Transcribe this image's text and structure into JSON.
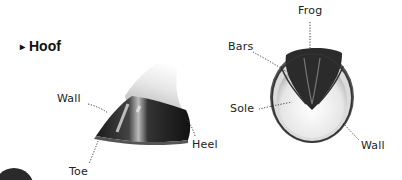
{
  "heading": {
    "marker": "▸",
    "title": "Hoof"
  },
  "side_view": {
    "labels": {
      "wall": "Wall",
      "heel": "Heel",
      "toe": "Toe"
    }
  },
  "sole_view": {
    "labels": {
      "frog": "Frog",
      "bars": "Bars",
      "sole": "Sole",
      "wall": "Wall"
    }
  }
}
